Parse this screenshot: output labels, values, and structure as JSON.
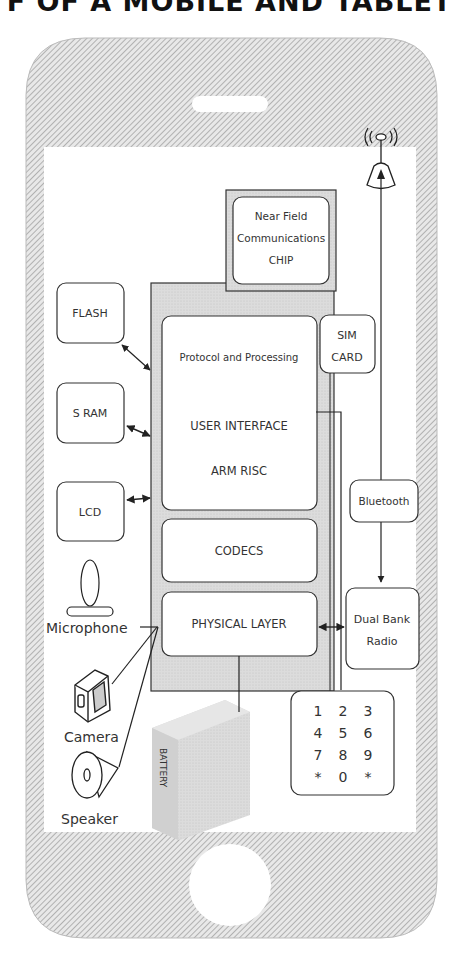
{
  "title": "F OF A MOBILE AND TABLET",
  "colors": {
    "hatch_bg": "#e6e6e6",
    "hatch_line": "#9a9a9a",
    "block_gray": "#d9d9d9",
    "stroke": "#333333",
    "screen": "#ffffff"
  },
  "blocks": {
    "nfc": [
      "Near Field",
      "Communications",
      "CHIP"
    ],
    "protocol": "Protocol and Processing",
    "user_interface": "USER INTERFACE",
    "arm": "ARM RISC",
    "codecs": "CODECS",
    "physical": "PHYSICAL LAYER",
    "sim": [
      "SIM",
      "CARD"
    ],
    "flash": "FLASH",
    "sram": "S RAM",
    "lcd": "LCD",
    "bluetooth": "Bluetooth",
    "radio": [
      "Dual Bank",
      "Radio"
    ],
    "battery": "BATTERY"
  },
  "peripherals": {
    "microphone": "Microphone",
    "camera": "Camera",
    "speaker": "Speaker"
  },
  "keypad": {
    "rows": [
      [
        "1",
        "2",
        "3"
      ],
      [
        "4",
        "5",
        "6"
      ],
      [
        "7",
        "8",
        "9"
      ],
      [
        "*",
        "0",
        "*"
      ]
    ]
  },
  "icons": {
    "antenna": "antenna-icon",
    "microphone": "microphone-icon",
    "camera": "camera-icon",
    "speaker": "speaker-icon",
    "battery": "battery-icon",
    "home_button": "home-button-icon",
    "earpiece": "earpiece-slot-icon"
  }
}
